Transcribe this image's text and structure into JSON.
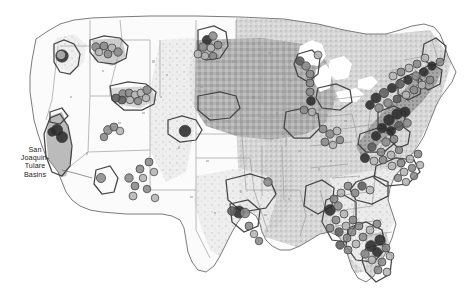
{
  "map": {
    "title": "United States NAWQA Study Units and Sampling Sites",
    "projection": "albers-usa",
    "background_color": "#ffffff",
    "outline_color": "#8c8c8c",
    "state_border_color": "#9a9a9a",
    "study_unit_outline_color": "#4d4d4d",
    "size": {
      "width": 476,
      "height": 299
    },
    "labels": [
      {
        "id": "san-joaquin-tulare",
        "text": "San\nJoaquin-\nTulare\nBasins",
        "x": 8,
        "y": 146,
        "leader_from": [
          62,
          170
        ],
        "leader_to": [
          92,
          178
        ]
      }
    ],
    "legend_present": false,
    "landcover_classes": [
      {
        "name": "agricultural-land",
        "color": "#a8a8a8"
      },
      {
        "name": "mixed-land",
        "color": "#c4c4c4"
      },
      {
        "name": "urban-developed",
        "color": "#7a7a7a"
      },
      {
        "name": "light-land",
        "color": "#e0e0e0"
      },
      {
        "name": "undeveloped",
        "color": "#ffffff"
      }
    ],
    "site_classes": [
      {
        "name": "high-concentration",
        "color": "#2b2b2b"
      },
      {
        "name": "medium-high-concentration",
        "color": "#5e5e5e"
      },
      {
        "name": "medium-concentration",
        "color": "#8a8a8a"
      },
      {
        "name": "low-concentration",
        "color": "#b5b5b5"
      },
      {
        "name": "very-low-concentration",
        "color": "#d6d6d6"
      }
    ],
    "study_units": [
      {
        "name": "willamette-basin",
        "region": "pacific-northwest"
      },
      {
        "name": "central-columbia-plateau",
        "region": "pacific-northwest"
      },
      {
        "name": "upper-snake-river-basin",
        "region": "northern-rockies"
      },
      {
        "name": "san-joaquin-tulare-basins",
        "region": "california"
      },
      {
        "name": "sacramento-valley",
        "region": "california"
      },
      {
        "name": "great-salt-lake-basins",
        "region": "great-basin"
      },
      {
        "name": "rio-grande-valley",
        "region": "southwest"
      },
      {
        "name": "central-nebraska-basins",
        "region": "great-plains"
      },
      {
        "name": "red-river-of-the-north",
        "region": "northern-plains"
      },
      {
        "name": "central-arkansas-basins",
        "region": "south-central"
      },
      {
        "name": "trinity-river-basin",
        "region": "texas"
      },
      {
        "name": "white-river-basin",
        "region": "midwest"
      },
      {
        "name": "lower-illinois-river",
        "region": "midwest"
      },
      {
        "name": "western-lake-michigan-drainages",
        "region": "great-lakes"
      },
      {
        "name": "lake-erie-lake-st-clair-drainages",
        "region": "great-lakes"
      },
      {
        "name": "potomac-river-basin",
        "region": "mid-atlantic"
      },
      {
        "name": "delmarva-peninsula",
        "region": "mid-atlantic"
      },
      {
        "name": "hudson-river-basin",
        "region": "northeast"
      },
      {
        "name": "connecticut-housatonic-thames",
        "region": "new-england"
      },
      {
        "name": "new-england-coastal-basins",
        "region": "new-england"
      },
      {
        "name": "albemarle-pamlico-drainage",
        "region": "southeast"
      },
      {
        "name": "santee-river-basin",
        "region": "southeast"
      },
      {
        "name": "apalachicola-chattahoochee-flint",
        "region": "southeast"
      },
      {
        "name": "georgia-florida-coastal-plain",
        "region": "southeast"
      },
      {
        "name": "southern-florida",
        "region": "florida"
      },
      {
        "name": "mobile-river-basin",
        "region": "gulf"
      }
    ]
  },
  "chart_data": {
    "type": "map",
    "site_count": 196,
    "sites": [
      {
        "x": 62,
        "y": 56,
        "r": 6.2,
        "v": 0.95
      },
      {
        "x": 61,
        "y": 55,
        "r": 4.6,
        "v": 0.2
      },
      {
        "x": 96,
        "y": 47,
        "r": 4.2,
        "v": 0.55
      },
      {
        "x": 104,
        "y": 46,
        "r": 4.0,
        "v": 0.4
      },
      {
        "x": 112,
        "y": 48,
        "r": 4.0,
        "v": 0.35
      },
      {
        "x": 118,
        "y": 52,
        "r": 4.2,
        "v": 0.62
      },
      {
        "x": 108,
        "y": 54,
        "r": 4.0,
        "v": 0.5
      },
      {
        "x": 99,
        "y": 52,
        "r": 3.8,
        "v": 0.3
      },
      {
        "x": 123,
        "y": 94,
        "r": 4.2,
        "v": 0.45
      },
      {
        "x": 129,
        "y": 93,
        "r": 4.0,
        "v": 0.6
      },
      {
        "x": 135,
        "y": 95,
        "r": 4.0,
        "v": 0.35
      },
      {
        "x": 141,
        "y": 93,
        "r": 4.0,
        "v": 0.28
      },
      {
        "x": 147,
        "y": 90,
        "r": 4.2,
        "v": 0.52
      },
      {
        "x": 122,
        "y": 100,
        "r": 4.0,
        "v": 0.66
      },
      {
        "x": 130,
        "y": 100,
        "r": 3.8,
        "v": 0.25
      },
      {
        "x": 138,
        "y": 101,
        "r": 3.8,
        "v": 0.42
      },
      {
        "x": 146,
        "y": 98,
        "r": 3.8,
        "v": 0.33
      },
      {
        "x": 116,
        "y": 98,
        "r": 4.0,
        "v": 0.72
      },
      {
        "x": 57,
        "y": 130,
        "r": 5.6,
        "v": 0.96
      },
      {
        "x": 62,
        "y": 137,
        "r": 5.6,
        "v": 0.97
      },
      {
        "x": 52,
        "y": 132,
        "r": 4.2,
        "v": 0.88
      },
      {
        "x": 108,
        "y": 130,
        "r": 4.4,
        "v": 0.4
      },
      {
        "x": 114,
        "y": 127,
        "r": 4.0,
        "v": 0.55
      },
      {
        "x": 120,
        "y": 131,
        "r": 3.8,
        "v": 0.33
      },
      {
        "x": 104,
        "y": 137,
        "r": 3.8,
        "v": 0.48
      },
      {
        "x": 185,
        "y": 131,
        "r": 5.8,
        "v": 0.94
      },
      {
        "x": 101,
        "y": 178,
        "r": 4.6,
        "v": 0.42
      },
      {
        "x": 207,
        "y": 40,
        "r": 4.6,
        "v": 0.92
      },
      {
        "x": 213,
        "y": 36,
        "r": 4.2,
        "v": 0.45
      },
      {
        "x": 203,
        "y": 47,
        "r": 4.2,
        "v": 0.38
      },
      {
        "x": 211,
        "y": 48,
        "r": 4.0,
        "v": 0.3
      },
      {
        "x": 218,
        "y": 45,
        "r": 4.0,
        "v": 0.55
      },
      {
        "x": 198,
        "y": 54,
        "r": 4.0,
        "v": 0.36
      },
      {
        "x": 205,
        "y": 56,
        "r": 3.8,
        "v": 0.28
      },
      {
        "x": 213,
        "y": 56,
        "r": 3.8,
        "v": 0.44
      },
      {
        "x": 129,
        "y": 178,
        "r": 4.2,
        "v": 0.4
      },
      {
        "x": 135,
        "y": 186,
        "r": 4.0,
        "v": 0.5
      },
      {
        "x": 133,
        "y": 196,
        "r": 4.0,
        "v": 0.3
      },
      {
        "x": 140,
        "y": 169,
        "r": 4.0,
        "v": 0.58
      },
      {
        "x": 143,
        "y": 178,
        "r": 3.8,
        "v": 0.35
      },
      {
        "x": 149,
        "y": 162,
        "r": 4.0,
        "v": 0.46
      },
      {
        "x": 154,
        "y": 172,
        "r": 3.8,
        "v": 0.27
      },
      {
        "x": 147,
        "y": 189,
        "r": 3.8,
        "v": 0.52
      },
      {
        "x": 155,
        "y": 198,
        "r": 3.8,
        "v": 0.33
      },
      {
        "x": 239,
        "y": 212,
        "r": 6.0,
        "v": 0.93
      },
      {
        "x": 245,
        "y": 213,
        "r": 4.8,
        "v": 0.58
      },
      {
        "x": 232,
        "y": 211,
        "r": 4.4,
        "v": 0.8
      },
      {
        "x": 249,
        "y": 226,
        "r": 4.0,
        "v": 0.44
      },
      {
        "x": 254,
        "y": 234,
        "r": 3.8,
        "v": 0.35
      },
      {
        "x": 259,
        "y": 241,
        "r": 3.8,
        "v": 0.48
      },
      {
        "x": 268,
        "y": 182,
        "r": 4.2,
        "v": 0.4
      },
      {
        "x": 300,
        "y": 61,
        "r": 4.2,
        "v": 0.65
      },
      {
        "x": 306,
        "y": 66,
        "r": 4.2,
        "v": 0.5
      },
      {
        "x": 310,
        "y": 74,
        "r": 4.0,
        "v": 0.42
      },
      {
        "x": 310,
        "y": 83,
        "r": 4.0,
        "v": 0.38
      },
      {
        "x": 310,
        "y": 92,
        "r": 4.0,
        "v": 0.56
      },
      {
        "x": 311,
        "y": 101,
        "r": 4.4,
        "v": 0.9
      },
      {
        "x": 304,
        "y": 110,
        "r": 4.0,
        "v": 0.46
      },
      {
        "x": 312,
        "y": 112,
        "r": 3.8,
        "v": 0.3
      },
      {
        "x": 318,
        "y": 55,
        "r": 4.0,
        "v": 0.35
      },
      {
        "x": 323,
        "y": 129,
        "r": 4.0,
        "v": 0.44
      },
      {
        "x": 330,
        "y": 134,
        "r": 4.2,
        "v": 0.52
      },
      {
        "x": 337,
        "y": 131,
        "r": 4.0,
        "v": 0.36
      },
      {
        "x": 325,
        "y": 142,
        "r": 4.0,
        "v": 0.6
      },
      {
        "x": 333,
        "y": 145,
        "r": 3.8,
        "v": 0.28
      },
      {
        "x": 340,
        "y": 140,
        "r": 3.8,
        "v": 0.48
      },
      {
        "x": 389,
        "y": 120,
        "r": 5.4,
        "v": 0.94
      },
      {
        "x": 397,
        "y": 114,
        "r": 5.2,
        "v": 0.91
      },
      {
        "x": 405,
        "y": 112,
        "r": 5.0,
        "v": 0.96
      },
      {
        "x": 382,
        "y": 128,
        "r": 4.8,
        "v": 0.93
      },
      {
        "x": 391,
        "y": 131,
        "r": 4.6,
        "v": 0.88
      },
      {
        "x": 399,
        "y": 126,
        "r": 4.4,
        "v": 0.7
      },
      {
        "x": 407,
        "y": 123,
        "r": 4.2,
        "v": 0.55
      },
      {
        "x": 376,
        "y": 136,
        "r": 4.6,
        "v": 0.9
      },
      {
        "x": 386,
        "y": 142,
        "r": 4.2,
        "v": 0.62
      },
      {
        "x": 394,
        "y": 139,
        "r": 4.0,
        "v": 0.45
      },
      {
        "x": 372,
        "y": 147,
        "r": 4.2,
        "v": 0.78
      },
      {
        "x": 381,
        "y": 152,
        "r": 4.0,
        "v": 0.4
      },
      {
        "x": 365,
        "y": 158,
        "r": 4.6,
        "v": 0.92
      },
      {
        "x": 374,
        "y": 161,
        "r": 4.0,
        "v": 0.34
      },
      {
        "x": 383,
        "y": 160,
        "r": 4.0,
        "v": 0.5
      },
      {
        "x": 391,
        "y": 155,
        "r": 4.0,
        "v": 0.32
      },
      {
        "x": 399,
        "y": 150,
        "r": 3.8,
        "v": 0.42
      },
      {
        "x": 392,
        "y": 166,
        "r": 4.0,
        "v": 0.36
      },
      {
        "x": 401,
        "y": 163,
        "r": 4.0,
        "v": 0.54
      },
      {
        "x": 410,
        "y": 159,
        "r": 4.0,
        "v": 0.3
      },
      {
        "x": 418,
        "y": 154,
        "r": 4.0,
        "v": 0.46
      },
      {
        "x": 404,
        "y": 172,
        "r": 4.0,
        "v": 0.28
      },
      {
        "x": 412,
        "y": 168,
        "r": 3.8,
        "v": 0.4
      },
      {
        "x": 420,
        "y": 165,
        "r": 3.8,
        "v": 0.33
      },
      {
        "x": 398,
        "y": 178,
        "r": 3.8,
        "v": 0.48
      },
      {
        "x": 406,
        "y": 182,
        "r": 3.8,
        "v": 0.26
      },
      {
        "x": 414,
        "y": 176,
        "r": 3.8,
        "v": 0.38
      },
      {
        "x": 376,
        "y": 98,
        "r": 5.0,
        "v": 0.95
      },
      {
        "x": 384,
        "y": 93,
        "r": 4.6,
        "v": 0.86
      },
      {
        "x": 392,
        "y": 88,
        "r": 4.6,
        "v": 0.93
      },
      {
        "x": 400,
        "y": 84,
        "r": 4.4,
        "v": 0.74
      },
      {
        "x": 408,
        "y": 80,
        "r": 4.4,
        "v": 0.9
      },
      {
        "x": 416,
        "y": 76,
        "r": 4.2,
        "v": 0.6
      },
      {
        "x": 424,
        "y": 72,
        "r": 4.2,
        "v": 0.96
      },
      {
        "x": 370,
        "y": 105,
        "r": 4.4,
        "v": 0.88
      },
      {
        "x": 379,
        "y": 108,
        "r": 4.2,
        "v": 0.55
      },
      {
        "x": 388,
        "y": 103,
        "r": 4.2,
        "v": 0.42
      },
      {
        "x": 397,
        "y": 99,
        "r": 4.0,
        "v": 0.68
      },
      {
        "x": 406,
        "y": 95,
        "r": 4.0,
        "v": 0.36
      },
      {
        "x": 414,
        "y": 90,
        "r": 4.0,
        "v": 0.5
      },
      {
        "x": 422,
        "y": 85,
        "r": 4.0,
        "v": 0.3
      },
      {
        "x": 430,
        "y": 80,
        "r": 4.0,
        "v": 0.44
      },
      {
        "x": 432,
        "y": 66,
        "r": 4.2,
        "v": 0.92
      },
      {
        "x": 440,
        "y": 62,
        "r": 4.0,
        "v": 0.58
      },
      {
        "x": 425,
        "y": 58,
        "r": 4.0,
        "v": 0.35
      },
      {
        "x": 417,
        "y": 64,
        "r": 4.0,
        "v": 0.48
      },
      {
        "x": 409,
        "y": 68,
        "r": 4.0,
        "v": 0.28
      },
      {
        "x": 401,
        "y": 72,
        "r": 4.0,
        "v": 0.4
      },
      {
        "x": 393,
        "y": 76,
        "r": 4.0,
        "v": 0.33
      },
      {
        "x": 362,
        "y": 186,
        "r": 4.2,
        "v": 0.8
      },
      {
        "x": 370,
        "y": 190,
        "r": 4.0,
        "v": 0.35
      },
      {
        "x": 355,
        "y": 193,
        "r": 4.0,
        "v": 0.52
      },
      {
        "x": 348,
        "y": 186,
        "r": 4.0,
        "v": 0.44
      },
      {
        "x": 341,
        "y": 193,
        "r": 4.0,
        "v": 0.3
      },
      {
        "x": 334,
        "y": 199,
        "r": 4.0,
        "v": 0.58
      },
      {
        "x": 330,
        "y": 210,
        "r": 5.4,
        "v": 0.94
      },
      {
        "x": 338,
        "y": 206,
        "r": 4.2,
        "v": 0.46
      },
      {
        "x": 344,
        "y": 214,
        "r": 4.0,
        "v": 0.36
      },
      {
        "x": 336,
        "y": 220,
        "r": 4.0,
        "v": 0.6
      },
      {
        "x": 330,
        "y": 228,
        "r": 4.0,
        "v": 0.4
      },
      {
        "x": 339,
        "y": 232,
        "r": 4.2,
        "v": 0.66
      },
      {
        "x": 346,
        "y": 226,
        "r": 4.0,
        "v": 0.32
      },
      {
        "x": 353,
        "y": 220,
        "r": 4.0,
        "v": 0.48
      },
      {
        "x": 347,
        "y": 238,
        "r": 4.0,
        "v": 0.54
      },
      {
        "x": 340,
        "y": 245,
        "r": 4.2,
        "v": 0.7
      },
      {
        "x": 348,
        "y": 250,
        "r": 4.0,
        "v": 0.38
      },
      {
        "x": 356,
        "y": 244,
        "r": 4.0,
        "v": 0.27
      },
      {
        "x": 363,
        "y": 237,
        "r": 4.0,
        "v": 0.44
      },
      {
        "x": 370,
        "y": 230,
        "r": 4.0,
        "v": 0.34
      },
      {
        "x": 377,
        "y": 224,
        "r": 4.0,
        "v": 0.5
      },
      {
        "x": 371,
        "y": 246,
        "r": 5.4,
        "v": 0.93
      },
      {
        "x": 380,
        "y": 240,
        "r": 5.2,
        "v": 0.9
      },
      {
        "x": 377,
        "y": 252,
        "r": 4.6,
        "v": 0.95
      },
      {
        "x": 365,
        "y": 254,
        "r": 4.2,
        "v": 0.56
      },
      {
        "x": 386,
        "y": 248,
        "r": 4.0,
        "v": 0.42
      },
      {
        "x": 372,
        "y": 260,
        "r": 4.0,
        "v": 0.36
      },
      {
        "x": 382,
        "y": 262,
        "r": 4.0,
        "v": 0.48
      },
      {
        "x": 390,
        "y": 256,
        "r": 4.0,
        "v": 0.3
      },
      {
        "x": 378,
        "y": 270,
        "r": 4.0,
        "v": 0.44
      },
      {
        "x": 387,
        "y": 272,
        "r": 4.0,
        "v": 0.26
      },
      {
        "x": 352,
        "y": 232,
        "r": 4.0,
        "v": 0.4
      },
      {
        "x": 359,
        "y": 226,
        "r": 4.0,
        "v": 0.62
      }
    ]
  }
}
